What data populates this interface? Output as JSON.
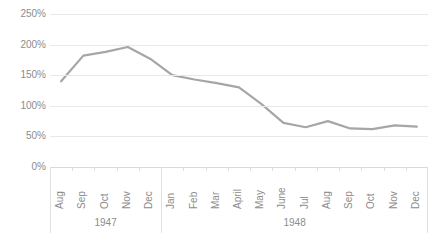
{
  "chart_data": {
    "type": "line",
    "title": "",
    "subtitle": "",
    "xlabel": "",
    "ylabel": "",
    "ylim": [
      0,
      250
    ],
    "ytick_values": [
      0,
      50,
      100,
      150,
      200,
      250
    ],
    "ytick_labels": [
      "0%",
      "50%",
      "100%",
      "150%",
      "200%",
      "250%"
    ],
    "grid": true,
    "legend": false,
    "legend_position": "none",
    "series_color": "#a6a6a6",
    "grid_color": "#e8e8e8",
    "text_color": "#8c8c8c",
    "categories": [
      "Aug",
      "Sep",
      "Oct",
      "Nov",
      "Dec",
      "Jan",
      "Feb",
      "Mar",
      "April",
      "May",
      "June",
      "Jul",
      "Aug",
      "Sep",
      "Oct",
      "Nov",
      "Dec"
    ],
    "values": [
      140,
      182,
      188,
      196,
      177,
      150,
      143,
      137,
      130,
      103,
      72,
      65,
      75,
      63,
      62,
      68,
      66
    ],
    "series": [
      {
        "name": "",
        "values": [
          140,
          182,
          188,
          196,
          177,
          150,
          143,
          137,
          130,
          103,
          72,
          65,
          75,
          63,
          62,
          68,
          66
        ]
      }
    ],
    "groups": [
      {
        "label": "1947",
        "count": 5
      },
      {
        "label": "1948",
        "count": 12
      }
    ]
  }
}
